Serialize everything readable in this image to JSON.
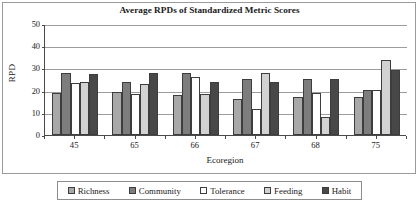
{
  "chart_data": {
    "type": "bar",
    "title": "Average RPDs of Standardized Metric Scores",
    "xlabel": "Ecoregion",
    "ylabel": "RPD",
    "categories": [
      "45",
      "65",
      "66",
      "67",
      "68",
      "75"
    ],
    "ylim": [
      0,
      50
    ],
    "yticks": [
      0,
      10,
      20,
      30,
      40,
      50
    ],
    "grid": true,
    "legend_position": "bottom",
    "series": [
      {
        "name": "Richness",
        "color": "#a8a8a8",
        "values": [
          19.0,
          19.3,
          18.0,
          16.3,
          17.3,
          17.0
        ]
      },
      {
        "name": "Community",
        "color": "#7d7d7d",
        "values": [
          28.0,
          24.0,
          28.1,
          25.4,
          25.4,
          20.5
        ]
      },
      {
        "name": "Tolerance",
        "color": "#ffffff",
        "values": [
          23.3,
          18.3,
          26.0,
          11.6,
          18.8,
          20.5
        ]
      },
      {
        "name": "Feeding",
        "color": "#d2d2d2",
        "values": [
          23.7,
          23.0,
          18.5,
          28.0,
          8.2,
          34.0
        ]
      },
      {
        "name": "Habit",
        "color": "#484848",
        "values": [
          27.5,
          28.1,
          24.1,
          24.1,
          25.4,
          29.2
        ]
      }
    ]
  }
}
